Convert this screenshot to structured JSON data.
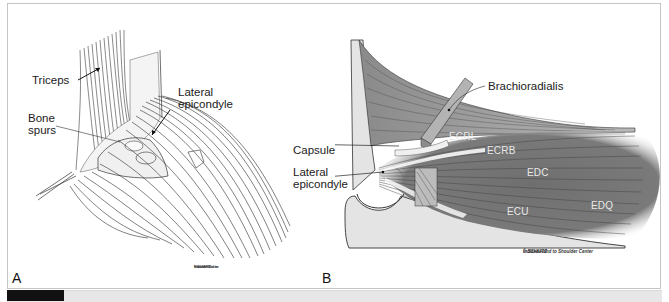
{
  "figure": {
    "panels": [
      {
        "id": "A",
        "letter": "A",
        "labels": {
          "triceps": "Triceps",
          "bone_spurs_line1": "Bone",
          "bone_spurs_line2": "spurs",
          "lateral_epicondyle_line1": "Lateral",
          "lateral_epicondyle_line2": "epicondyle"
        },
        "credit": {
          "line1": "© SCHNITZ",
          "line2": "Indiana Hand to",
          "line3": "Shoulder Center"
        }
      },
      {
        "id": "B",
        "letter": "B",
        "labels": {
          "brachioradialis": "Brachioradialis",
          "capsule": "Capsule",
          "lateral_epicondyle_line1": "Lateral",
          "lateral_epicondyle_line2": "epicondyle"
        },
        "muscle_labels": {
          "ecrl": "ECRL",
          "ecrb": "ECRB",
          "edc": "EDC",
          "ecu": "ECU",
          "edq": "EDQ"
        },
        "credit": {
          "line1": "© SCHNITZ",
          "line2": "Indiana Hand to Shoulder Center"
        }
      }
    ],
    "colors": {
      "muscle_dark": "#6e6e6e",
      "muscle_mid": "#9a9a9a",
      "bone": "#e4e4e4",
      "line_art": "#2a2a2a",
      "frame_border": "#c4c4c4",
      "footer_bar": "#e7e7e7",
      "footer_black": "#111111"
    }
  }
}
